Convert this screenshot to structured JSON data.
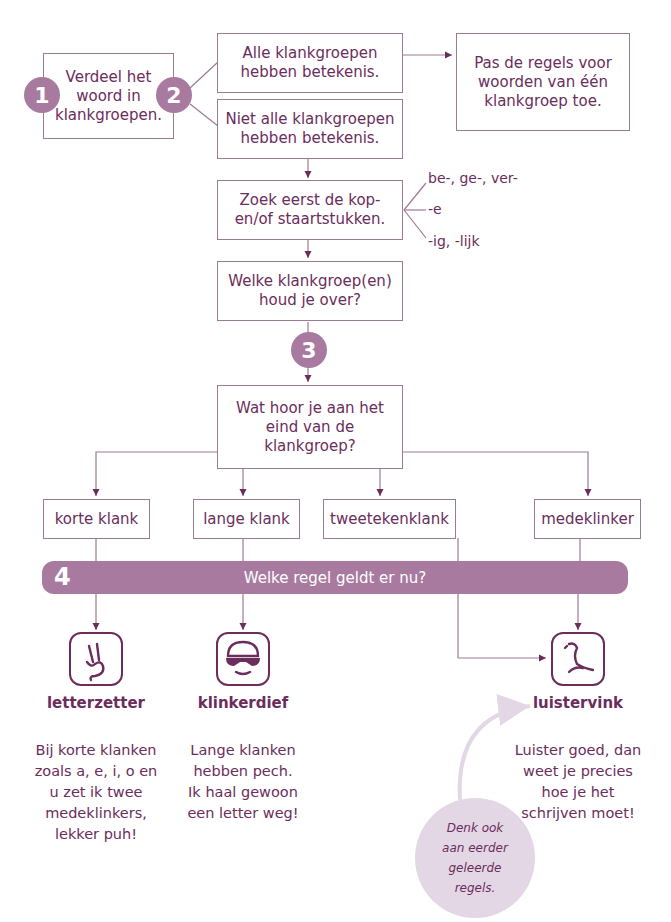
{
  "steps": {
    "step1": {
      "number": "1",
      "text": "Verdeel het woord in klankgroepen."
    },
    "step2": {
      "number": "2",
      "option_all": "Alle klankgroepen hebben betekenis.",
      "option_not_all": "Niet alle klankgroepen hebben betekenis.",
      "result_all": "Pas de regels voor woorden van één klankgroep toe."
    },
    "find_affixes": {
      "text": "Zoek eerst de kop- en/of staartstukken.",
      "affixes": [
        "be-, ge-, ver-",
        "-e",
        "-ig, -lijk"
      ]
    },
    "remaining": {
      "text": "Welke klankgroep(en) houd je over?"
    },
    "step3": {
      "number": "3",
      "text": "Wat hoor je aan het eind van de klankgroep?"
    },
    "categories": [
      "korte klank",
      "lange klank",
      "tweetekenklank",
      "medeklinker"
    ],
    "step4": {
      "number": "4",
      "text": "Welke regel geldt er nu?"
    }
  },
  "characters": [
    {
      "icon": "two-fingers-hand-icon",
      "name": "letterzetter",
      "description": "Bij korte klanken zoals a, e, i, o en u zet ik twee medeklinkers, lekker puh!"
    },
    {
      "icon": "masked-thief-icon",
      "name": "klinkerdief",
      "description": "Lange klanken hebben pech. Ik haal gewoon een letter weg!"
    },
    {
      "icon": "bird-icon",
      "name": "luistervink",
      "description": "Luister goed, dan weet je precies hoe je het schrijven moet!"
    }
  ],
  "note": "Denk ook aan eerder geleerde regels.",
  "colors": {
    "primary": "#6b2d5c",
    "accent": "#a97a9f",
    "border": "#9c7a93",
    "note_bg": "#e3d7e6"
  }
}
